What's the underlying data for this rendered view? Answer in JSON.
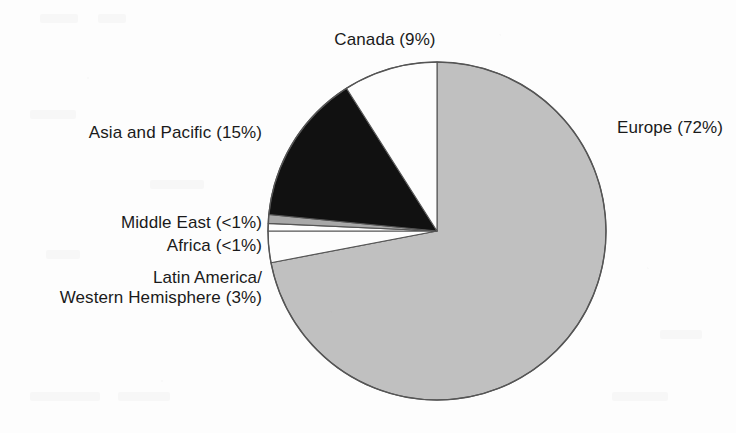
{
  "chart_data": {
    "type": "pie",
    "title": "",
    "subtitle": "",
    "xlabel": "",
    "ylabel": "",
    "legend_position": "callout-labels",
    "grid": false,
    "start_angle_deg": 0,
    "direction": "clockwise",
    "center": {
      "x": 437,
      "y": 231
    },
    "radius": 169,
    "categories": [
      "Europe",
      "Latin America/Western Hemisphere",
      "Africa",
      "Middle East",
      "Asia and Pacific",
      "Canada"
    ],
    "values": [
      72,
      3,
      0.5,
      0.5,
      15,
      9
    ],
    "value_labels": [
      "72%",
      "3%",
      "<1%",
      "<1%",
      "15%",
      "9%"
    ],
    "slices": [
      {
        "name": "Europe",
        "value": 72,
        "value_label": "72%",
        "display": "Europe (72%)",
        "color": "#c0c0c0",
        "start_deg": 0,
        "sweep_deg": 259.2
      },
      {
        "name": "Latin America/Western Hemisphere",
        "value": 3,
        "value_label": "3%",
        "display_line1": "Latin America/",
        "display_line2": "Western Hemisphere (3%)",
        "color": "#fdfdfd",
        "start_deg": 259.2,
        "sweep_deg": 10.8
      },
      {
        "name": "Africa",
        "value": 0.5,
        "value_label": "<1%",
        "display": "Africa (<1%)",
        "color": "#fdfdfd",
        "start_deg": 270.0,
        "sweep_deg": 2.6
      },
      {
        "name": "Middle East",
        "value": 0.5,
        "value_label": "<1%",
        "display": "Middle East (<1%)",
        "color": "#a8a8a8",
        "start_deg": 272.6,
        "sweep_deg": 3.0
      },
      {
        "name": "Asia and Pacific",
        "value": 15,
        "value_label": "15%",
        "display": "Asia and Pacific (15%)",
        "color": "#111111",
        "start_deg": 275.6,
        "sweep_deg": 52.0
      },
      {
        "name": "Canada",
        "value": 9,
        "value_label": "9%",
        "display": "Canada (9%)",
        "color": "#fdfdfd",
        "start_deg": 327.6,
        "sweep_deg": 32.4
      }
    ]
  },
  "labels": {
    "canada": "Canada (9%)",
    "europe": "Europe (72%)",
    "asia_pacific": "Asia and Pacific (15%)",
    "middle_east": "Middle East (<1%)",
    "africa": "Africa (<1%)",
    "latin_america_line1": "Latin America/",
    "latin_america_line2": "Western Hemisphere (3%)"
  },
  "colors": {
    "europe": "#c0c0c0",
    "asia_pacific": "#111111",
    "middle_east": "#a8a8a8",
    "canada": "#fdfdfd",
    "africa": "#fdfdfd",
    "latin_america": "#fdfdfd",
    "outline": "#555555",
    "background": "#fdfdfd",
    "text": "#1a1a1a"
  }
}
